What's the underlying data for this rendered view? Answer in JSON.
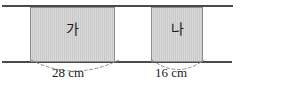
{
  "figure": {
    "type": "geometry-diagram",
    "width_px": 287,
    "height_px": 98,
    "background_color": "#ffffff"
  },
  "guide_lines": {
    "line_color": "#4a4a4a",
    "top": {
      "name": "top-parallel-line"
    },
    "bottom": {
      "name": "bottom-parallel-line"
    }
  },
  "rectangles": [
    {
      "id": "a",
      "label": "가",
      "width_label": "28 cm",
      "width_value": 28,
      "unit": "cm",
      "fill_color": "#c9c9c9",
      "border_color": "#8d8d8d"
    },
    {
      "id": "b",
      "label": "나",
      "width_label": "16 cm",
      "width_value": 16,
      "unit": "cm",
      "fill_color": "#c9c9c9",
      "border_color": "#8d8d8d"
    }
  ],
  "dimension_markers": {
    "style": "dashed-arc",
    "stroke_color": "#8f8f8f",
    "items": [
      {
        "name": "dimension-28cm",
        "text": "28 cm"
      },
      {
        "name": "dimension-16cm",
        "text": "16 cm"
      }
    ]
  }
}
